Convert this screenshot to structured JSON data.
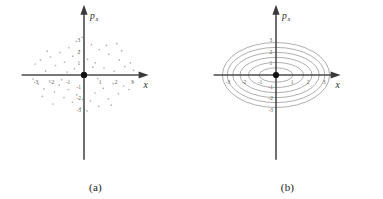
{
  "figure": {
    "background": "#ffffff",
    "panels": [
      {
        "id": "panel-a",
        "caption": "(a)",
        "plot_type": "scatter",
        "axis": {
          "x_label": "x",
          "y_label_base": "p",
          "y_label_sub": "x",
          "x_ticks": [
            "-3",
            "-2",
            "-1",
            "1",
            "2",
            "3"
          ],
          "y_ticks": [
            "3",
            "2",
            "1",
            "-1",
            "-2",
            "-3"
          ],
          "x_tick_values": [
            -3,
            -2,
            -1,
            1,
            2,
            3
          ],
          "y_tick_values": [
            3,
            2,
            1,
            -1,
            -2,
            -3
          ],
          "origin_label": "",
          "axis_color": "#4a4a4a",
          "tick_color": "#5a5a5a"
        }
      },
      {
        "id": "panel-b",
        "caption": "(b)",
        "plot_type": "contour",
        "axis": {
          "x_label": "x",
          "y_label_base": "p",
          "y_label_sub": "x",
          "x_ticks": [
            "-3",
            "-2",
            "-1",
            "1",
            "2",
            "3"
          ],
          "y_ticks": [
            "3",
            "2",
            "1",
            "-1",
            "-2",
            "-3"
          ],
          "x_tick_values": [
            -3,
            -2,
            -1,
            1,
            2,
            3
          ],
          "y_tick_values": [
            3,
            2,
            1,
            -1,
            -2,
            -3
          ],
          "axis_color": "#4a4a4a",
          "tick_color": "#5a5a5a"
        }
      }
    ]
  },
  "chart_data": [
    {
      "type": "scatter",
      "title": "(a)",
      "xlabel": "x",
      "ylabel": "p_x",
      "xlim": [
        -3.6,
        3.6
      ],
      "ylim": [
        -3.6,
        3.6
      ],
      "grid": false,
      "legend": null,
      "marker_color": "#9a9a9a",
      "description": "Sparse scattered phase-space points arranged along faint radial/spiral rays about the origin",
      "points": [
        [
          -3.05,
          0.95
        ],
        [
          -2.72,
          1.28
        ],
        [
          -2.4,
          0.35
        ],
        [
          -2.1,
          1.55
        ],
        [
          -1.78,
          0.82
        ],
        [
          -1.5,
          1.95
        ],
        [
          -1.22,
          1.1
        ],
        [
          -0.95,
          2.35
        ],
        [
          -0.7,
          1.62
        ],
        [
          -0.48,
          2.9
        ],
        [
          -0.28,
          2.1
        ],
        [
          -0.12,
          3.25
        ],
        [
          0.22,
          1.35
        ],
        [
          0.46,
          2.62
        ],
        [
          0.7,
          1.05
        ],
        [
          0.95,
          2.2
        ],
        [
          1.25,
          0.6
        ],
        [
          1.55,
          1.78
        ],
        [
          1.88,
          0.32
        ],
        [
          2.2,
          1.3
        ],
        [
          2.55,
          0.72
        ],
        [
          2.9,
          1.05
        ],
        [
          3.1,
          0.4
        ],
        [
          -3.18,
          -0.35
        ],
        [
          -2.85,
          -0.78
        ],
        [
          -2.5,
          -1.2
        ],
        [
          -2.15,
          -0.5
        ],
        [
          -1.85,
          -1.45
        ],
        [
          -1.55,
          -0.88
        ],
        [
          -1.25,
          -1.95
        ],
        [
          -0.98,
          -1.25
        ],
        [
          -0.72,
          -2.35
        ],
        [
          -0.45,
          -1.7
        ],
        [
          -0.22,
          -2.85
        ],
        [
          -0.08,
          -2.1
        ],
        [
          0.18,
          -3.1
        ],
        [
          0.4,
          -2.25
        ],
        [
          0.68,
          -1.55
        ],
        [
          0.92,
          -2.7
        ],
        [
          1.2,
          -1.15
        ],
        [
          1.52,
          -2.05
        ],
        [
          1.82,
          -0.75
        ],
        [
          2.15,
          -1.6
        ],
        [
          2.48,
          -0.95
        ],
        [
          2.82,
          -1.25
        ],
        [
          3.08,
          -0.62
        ],
        [
          -1.05,
          0.25
        ],
        [
          0.85,
          -0.3
        ],
        [
          1.4,
          2.55
        ],
        [
          -2.3,
          2.05
        ],
        [
          2.35,
          2.1
        ],
        [
          -1.95,
          -2.5
        ],
        [
          1.7,
          -2.6
        ],
        [
          -0.6,
          0.55
        ],
        [
          0.55,
          0.7
        ],
        [
          -1.4,
          -0.4
        ],
        [
          2.05,
          2.7
        ],
        [
          -2.6,
          -1.85
        ]
      ]
    },
    {
      "type": "contour",
      "title": "(b)",
      "xlabel": "x",
      "ylabel": "p_x",
      "xlim": [
        -3.6,
        3.6
      ],
      "ylim": [
        -3.6,
        3.6
      ],
      "grid": false,
      "legend": null,
      "curve_color": "#8c8c8c",
      "description": "Six nested concentric ellipses (level sets of a harmonic-oscillator Hamiltonian) centered on the origin",
      "ellipses": [
        {
          "rx": 1.05,
          "ry": 0.62
        },
        {
          "rx": 1.72,
          "ry": 1.08
        },
        {
          "rx": 2.25,
          "ry": 1.52
        },
        {
          "rx": 2.7,
          "ry": 1.95
        },
        {
          "rx": 3.05,
          "ry": 2.38
        },
        {
          "rx": 3.35,
          "ry": 2.8
        }
      ]
    }
  ]
}
